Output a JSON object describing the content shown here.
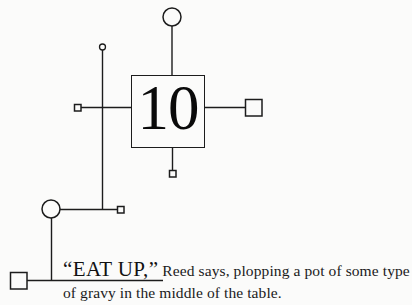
{
  "page": {
    "background_color": "#fbfbfa",
    "ink_color": "#1c1c1c",
    "width": 412,
    "height": 305
  },
  "diagram": {
    "label": "mind-map style node diagram",
    "central_node": {
      "value": "10",
      "shape": "square",
      "x": 131,
      "y": 75,
      "width": 74,
      "height": 73
    },
    "connectors": [
      {
        "name": "top-branch",
        "endpoint_shape": "circle",
        "endpoint_size": "large",
        "cx": 172,
        "cy": 17,
        "r": 9
      },
      {
        "name": "right-branch",
        "endpoint_shape": "square",
        "endpoint_size": "medium",
        "x": 245,
        "y": 99,
        "size": 17
      },
      {
        "name": "bottom-branch",
        "endpoint_shape": "square",
        "endpoint_size": "small",
        "x": 169,
        "y": 170,
        "size": 7
      },
      {
        "name": "left-branch",
        "endpoint_shape": "square",
        "endpoint_size": "small",
        "x": 74,
        "y": 104,
        "size": 7
      },
      {
        "name": "upper-spine-cap",
        "endpoint_shape": "circle",
        "endpoint_size": "small",
        "cx": 102,
        "cy": 47,
        "r": 3
      },
      {
        "name": "mid-branch",
        "endpoint_shape": "square",
        "endpoint_size": "small",
        "x": 117,
        "y": 206,
        "size": 7
      },
      {
        "name": "lower-hub",
        "endpoint_shape": "circle",
        "endpoint_size": "large",
        "cx": 51,
        "cy": 209,
        "r": 9
      },
      {
        "name": "bottom-left-terminal",
        "endpoint_shape": "square",
        "endpoint_size": "medium",
        "x": 10,
        "y": 272,
        "size": 17
      }
    ]
  },
  "caption": {
    "shout_open_quote": "“",
    "shout_text_first": "E",
    "shout_text_rest": "AT",
    "shout_text_second_first": "U",
    "shout_text_second_rest": "P,",
    "shout_close_quote": "”",
    "shout_full": "“EAT UP,”",
    "narration_line_1": "Reed says, plopping a pot of some type",
    "narration_line_2": "of gravy in the middle of the table."
  }
}
